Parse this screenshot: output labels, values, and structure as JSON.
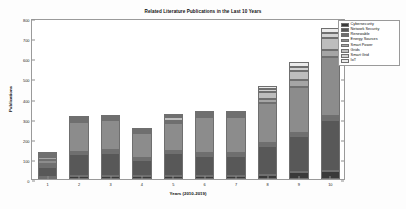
{
  "chart_data": {
    "type": "bar",
    "stacked": true,
    "title": "Related Literature Publications in the Last 10 Years",
    "xlabel": "Years (2010-2019)",
    "ylabel": "Publications",
    "categories": [
      "1",
      "2",
      "3",
      "4",
      "5",
      "6",
      "7",
      "8",
      "9",
      "10"
    ],
    "ylim": [
      0,
      800
    ],
    "yticks": [
      0,
      100,
      200,
      300,
      400,
      500,
      600,
      700,
      800
    ],
    "grid": false,
    "legend_position": "upper right",
    "series": [
      {
        "name": "Cybersecurity",
        "color": "#3a3a3a",
        "values": [
          12,
          14,
          15,
          13,
          16,
          15,
          15,
          20,
          35,
          40
        ]
      },
      {
        "name": "Network Security",
        "color": "#585858",
        "values": [
          50,
          110,
          115,
          82,
          112,
          100,
          100,
          145,
          180,
          255
        ]
      },
      {
        "name": "Renewable",
        "color": "#6e6e6e",
        "values": [
          12,
          10,
          12,
          10,
          12,
          12,
          12,
          12,
          15,
          20
        ]
      },
      {
        "name": "Energy Sources",
        "color": "#8c8c8c",
        "values": [
          22,
          150,
          150,
          122,
          140,
          180,
          180,
          200,
          225,
          290
        ]
      },
      {
        "name": "Smart Power",
        "color": "#a5a5a5",
        "values": [
          12,
          8,
          8,
          8,
          10,
          10,
          10,
          22,
          35,
          35
        ]
      },
      {
        "name": "Grids",
        "color": "#bdbdbd",
        "values": [
          12,
          5,
          5,
          5,
          18,
          8,
          8,
          35,
          45,
          60
        ]
      },
      {
        "name": "Smart Grid",
        "color": "#d2d2d2",
        "values": [
          5,
          5,
          5,
          5,
          7,
          5,
          5,
          12,
          20,
          25
        ]
      },
      {
        "name": "IoT",
        "color": "#ebebeb",
        "values": [
          5,
          5,
          5,
          5,
          5,
          5,
          5,
          14,
          25,
          25
        ]
      }
    ]
  },
  "legend": {
    "items": [
      {
        "label": "Cybersecurity",
        "color": "#3a3a3a"
      },
      {
        "label": "Network Security",
        "color": "#585858"
      },
      {
        "label": "Renewable",
        "color": "#6e6e6e"
      },
      {
        "label": "Energy Sources",
        "color": "#8c8c8c"
      },
      {
        "label": "Smart Power",
        "color": "#a5a5a5"
      },
      {
        "label": "Grids",
        "color": "#bdbdbd"
      },
      {
        "label": "Smart Grid",
        "color": "#d2d2d2"
      },
      {
        "label": "IoT",
        "color": "#ebebeb"
      }
    ]
  }
}
